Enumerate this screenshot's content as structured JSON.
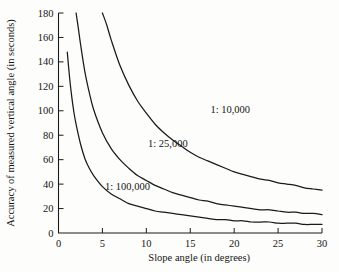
{
  "chart_data": {
    "type": "line",
    "title": "",
    "xlabel": "Slope angle (in degrees)",
    "ylabel": "Accuracy of measured vertical angle (in seconds)",
    "xlim": [
      0,
      30
    ],
    "ylim": [
      0,
      180
    ],
    "xticks": [
      0,
      5,
      10,
      15,
      20,
      25,
      30
    ],
    "xticklabels": [
      "0",
      "5",
      "10",
      "15",
      "20",
      "25",
      "30"
    ],
    "yticks": [
      0,
      20,
      40,
      60,
      80,
      100,
      120,
      140,
      160,
      180
    ],
    "yticklabels": [
      "0",
      "20",
      "40",
      "60",
      "80",
      "100",
      "120",
      "140",
      "160",
      "180"
    ],
    "grid": false,
    "legend": "inline-curve-labels",
    "series": [
      {
        "name": "1: 10,000",
        "label": "1: 10,000",
        "label_x": 17.3,
        "label_y": 98,
        "color": "#1a1a1a",
        "x": [
          5.0,
          5.5,
          6,
          7,
          8,
          9,
          10,
          11,
          12,
          13,
          14,
          15,
          16,
          17,
          18,
          19,
          20,
          21,
          22,
          23,
          24,
          25,
          26,
          27,
          28,
          29,
          30
        ],
        "y": [
          180,
          170,
          158,
          137,
          121,
          108,
          98,
          89,
          82,
          76,
          71,
          66,
          62,
          59,
          56,
          53,
          50,
          48,
          46,
          44,
          43,
          41,
          40,
          39,
          37,
          36,
          35
        ]
      },
      {
        "name": "1: 25,000",
        "label": "1: 25,000",
        "label_x": 10.2,
        "label_y": 70,
        "color": "#1a1a1a",
        "x": [
          2.0,
          2.25,
          2.5,
          3,
          3.5,
          4,
          5,
          6,
          7,
          8,
          9,
          10,
          11,
          12,
          13,
          14,
          15,
          16,
          17,
          18,
          19,
          20,
          21,
          22,
          23,
          24,
          25,
          26,
          27,
          28,
          29,
          30
        ],
        "y": [
          180,
          168,
          155,
          132,
          115,
          101,
          82,
          69,
          60,
          53,
          47,
          43,
          39,
          36,
          33,
          31,
          29,
          27,
          26,
          24,
          23,
          22,
          21,
          20,
          19,
          19,
          18,
          17,
          17,
          16,
          16,
          15
        ]
      },
      {
        "name": "1: 100,000",
        "label": "1: 100,000",
        "label_x": 5.3,
        "label_y": 35,
        "color": "#1a1a1a",
        "x": [
          1.0,
          1.25,
          1.5,
          1.75,
          2,
          2.5,
          3,
          3.5,
          4,
          5,
          6,
          7,
          8,
          9,
          10,
          11,
          12,
          13,
          14,
          15,
          16,
          17,
          18,
          19,
          20,
          21,
          22,
          23,
          24,
          25,
          26,
          27,
          28,
          29,
          30
        ],
        "y": [
          148,
          128,
          112,
          99,
          89,
          73,
          61,
          53,
          47,
          38,
          32,
          28,
          24,
          22,
          20,
          18,
          17,
          16,
          15,
          14,
          13,
          12,
          11,
          11,
          10,
          10,
          9,
          9,
          9,
          8,
          8,
          8,
          7,
          7,
          7
        ]
      }
    ]
  },
  "colors": {
    "background": "#fdfdfb",
    "ink": "#1a1a1a"
  }
}
